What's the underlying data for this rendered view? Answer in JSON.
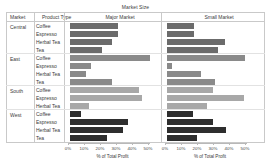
{
  "chart_data": {
    "type": "bar",
    "title": "Market Size",
    "xlabel": "% of Total Profit",
    "ylabel": "",
    "xlim": [
      0,
      55
    ],
    "grid": false,
    "legend": "none",
    "orientation": "horizontal",
    "panels": [
      "Major Market",
      "Small Market"
    ],
    "row_headers": [
      "Market",
      "Product Type"
    ],
    "tick_labels": [
      "0%",
      "10%",
      "20%",
      "30%",
      "40%",
      "50%"
    ],
    "tick_values": [
      0,
      10,
      20,
      30,
      40,
      50
    ],
    "colors": {
      "Central": "#6b6b6b",
      "East": "#8a8a8a",
      "South": "#a8a8a8",
      "West": "#2e2e2e"
    },
    "groups": [
      {
        "market": "Central",
        "rows": [
          {
            "product": "Coffee",
            "major": 30,
            "small": 17
          },
          {
            "product": "Espresso",
            "major": 30,
            "small": 17
          },
          {
            "product": "Herbal Tea",
            "major": 26,
            "small": 36
          },
          {
            "product": "Tea",
            "major": 20,
            "small": 32
          }
        ]
      },
      {
        "market": "East",
        "rows": [
          {
            "product": "Coffee",
            "major": 50,
            "small": 49
          },
          {
            "product": "Espresso",
            "major": 13,
            "small": 3
          },
          {
            "product": "Herbal Tea",
            "major": 10,
            "small": 21
          },
          {
            "product": "Tea",
            "major": 26,
            "small": 30
          }
        ]
      },
      {
        "market": "South",
        "rows": [
          {
            "product": "Coffee",
            "major": 43,
            "small": 29
          },
          {
            "product": "Espresso",
            "major": 45,
            "small": 48
          },
          {
            "product": "Herbal Tea",
            "major": 12,
            "small": 25
          }
        ]
      },
      {
        "market": "West",
        "rows": [
          {
            "product": "Coffee",
            "major": 7,
            "small": 16
          },
          {
            "product": "Espresso",
            "major": 36,
            "small": 29
          },
          {
            "product": "Herbal Tea",
            "major": 33,
            "small": 37
          },
          {
            "product": "Tea",
            "major": 23,
            "small": 19
          }
        ]
      }
    ]
  }
}
